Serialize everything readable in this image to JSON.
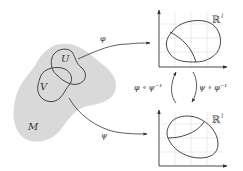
{
  "diagram": {
    "type": "manifold-charts",
    "manifold": {
      "label": "M",
      "fill": "#d9d9d9"
    },
    "open_sets": [
      {
        "id": "U",
        "label": "U"
      },
      {
        "id": "V",
        "label": "V"
      }
    ],
    "chart_spaces": [
      {
        "id": "top",
        "label": "ℝ",
        "superscript": "l"
      },
      {
        "id": "bottom",
        "label": "ℝ",
        "superscript": "l"
      }
    ],
    "maps": {
      "phi": {
        "label": "φ",
        "from": "U",
        "to": "top"
      },
      "psi": {
        "label": "ψ",
        "from": "V",
        "to": "bottom"
      },
      "transition_up": {
        "label": "φ ∘ ψ⁻¹",
        "from": "bottom",
        "to": "top"
      },
      "transition_down": {
        "label": "ψ ∘ φ⁻¹",
        "from": "top",
        "to": "bottom"
      }
    },
    "colors": {
      "stroke": "#333333",
      "grid": "#e6e6e6",
      "manifold_fill": "#d9d9d9"
    }
  }
}
